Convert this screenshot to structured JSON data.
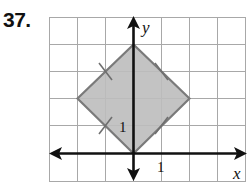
{
  "problem": {
    "number": "37."
  },
  "graph": {
    "x_axis_label": "x",
    "y_axis_label": "y",
    "x_tick_label": "1",
    "y_tick_label": "1",
    "grid": {
      "x_range": [
        -3,
        4
      ],
      "y_range": [
        -1,
        5
      ],
      "cell_size_units": 1
    },
    "shape": {
      "type": "square (rotated 45°)",
      "vertices": [
        [
          0,
          0
        ],
        [
          2,
          2
        ],
        [
          0,
          4
        ],
        [
          -2,
          2
        ]
      ],
      "fill": "#bdbdbd",
      "stroke": "#7a7a7a",
      "congruence_ticks_on_sides": 4
    },
    "colors": {
      "grid": "#a8a8a8",
      "axes": "#111111"
    }
  }
}
